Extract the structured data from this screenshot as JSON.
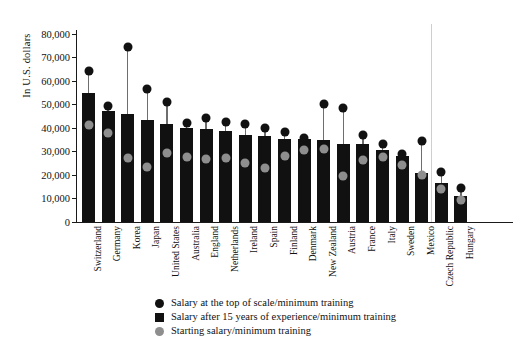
{
  "chart_data": {
    "type": "bar",
    "title": "",
    "xlabel": "",
    "ylabel": "In U.S. dollars",
    "ylim": [
      0,
      85000
    ],
    "ytick_values": [
      0,
      10000,
      20000,
      30000,
      40000,
      50000,
      60000,
      70000,
      80000
    ],
    "ytick_labels": [
      "0",
      "10,000",
      "20,000",
      "30,000",
      "40,000",
      "50,000",
      "60,000",
      "70,000",
      "80,000"
    ],
    "grid": false,
    "legend_position": "bottom-center",
    "categories": [
      "Switzerland",
      "Germany",
      "Korea",
      "Japan",
      "United States",
      "Australia",
      "England",
      "Netherlands",
      "Ireland",
      "Spain",
      "Finland",
      "Denmark",
      "New Zealand",
      "Austria",
      "France",
      "Italy",
      "Sweden",
      "Mexico",
      "Czech Republic",
      "Hungary"
    ],
    "series": [
      {
        "name": "Salary after 15 years of experience/minimum training",
        "marker": "square",
        "color": "#111111",
        "render": "bar",
        "values": [
          54800,
          47000,
          45700,
          43500,
          41700,
          39900,
          39600,
          38700,
          36900,
          36600,
          35400,
          35400,
          35000,
          33300,
          33200,
          30700,
          27900,
          21000,
          16600,
          11100
        ]
      },
      {
        "name": "Salary at the top of scale/minimum training",
        "marker": "circle",
        "color": "#111111",
        "render": "dot",
        "values": [
          64300,
          49400,
          74500,
          56400,
          50900,
          42100,
          44200,
          42500,
          41500,
          39800,
          38200,
          35700,
          50100,
          48300,
          37000,
          33000,
          28900,
          34600,
          21300,
          14400
        ]
      },
      {
        "name": "Starting salary/minimum training",
        "marker": "circle",
        "color": "#8e8e8e",
        "render": "dot",
        "values": [
          41400,
          37700,
          27400,
          23300,
          29200,
          27500,
          26800,
          27400,
          25200,
          22900,
          27900,
          30700,
          31200,
          19600,
          26500,
          27500,
          24400,
          20000,
          14100,
          9500
        ]
      }
    ]
  },
  "legend": {
    "items": [
      {
        "icon": "circle-dark-icon",
        "label": "Salary at the top of scale/minimum training"
      },
      {
        "icon": "square-dark-icon",
        "label": "Salary after 15 years of experience/minimum training"
      },
      {
        "icon": "circle-gray-icon",
        "label": "Starting salary/minimum training"
      }
    ]
  },
  "annotations": {
    "separator_after_category_index": 17
  }
}
